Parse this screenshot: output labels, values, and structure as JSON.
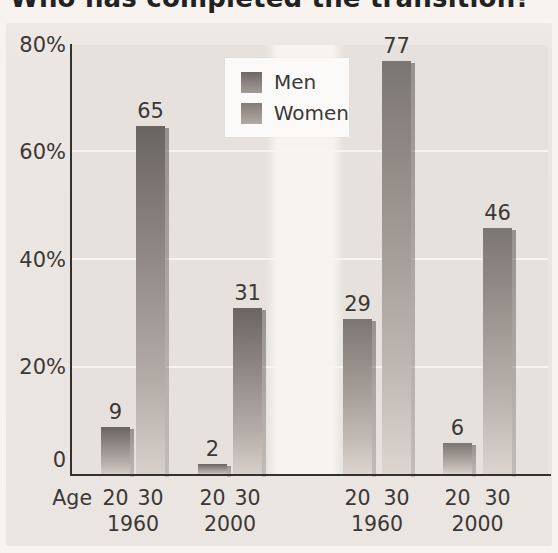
{
  "title": "Who has completed the transition?",
  "chart_data": {
    "type": "bar",
    "title": "Who has completed the transition?",
    "unit": "percent",
    "ylim": [
      0,
      80
    ],
    "yticks": [
      "80%",
      "60%",
      "40%",
      "20%",
      "0"
    ],
    "age_axis_label": "Age",
    "grid": true,
    "legend": [
      "Men",
      "Women"
    ],
    "legend_position": "inside-top-center-left",
    "groups": [
      {
        "series": "Men",
        "year": "1960",
        "points": [
          {
            "age": "20",
            "value": 9
          },
          {
            "age": "30",
            "value": 65
          }
        ]
      },
      {
        "series": "Men",
        "year": "2000",
        "points": [
          {
            "age": "20",
            "value": 2
          },
          {
            "age": "30",
            "value": 31
          }
        ]
      },
      {
        "series": "Women",
        "year": "1960",
        "points": [
          {
            "age": "20",
            "value": 29
          },
          {
            "age": "30",
            "value": 77
          }
        ]
      },
      {
        "series": "Women",
        "year": "2000",
        "points": [
          {
            "age": "20",
            "value": 6
          },
          {
            "age": "30",
            "value": 46
          }
        ]
      }
    ]
  },
  "colors": {
    "page_bg": "#f9f3f0",
    "panel_bg": "#eae5e1",
    "plot_bg": "#e6e1dd",
    "gridline": "#f6f3f0",
    "axis": "#33302d",
    "text": "#3b3835",
    "men_bar_top": "#6b6562",
    "men_bar_bottom": "#d8d1cb",
    "women_bar_top": "#7c7672",
    "women_bar_bottom": "#ddd6d0",
    "legend_bg": "#fbfaf9"
  }
}
